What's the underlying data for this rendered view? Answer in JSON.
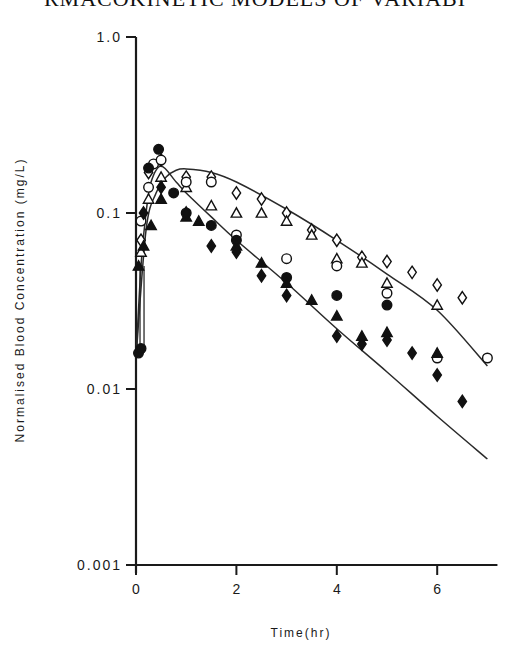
{
  "header": {
    "text": "RMACOKINETIC MODELS OF VARIABI"
  },
  "chart_data": {
    "type": "scatter",
    "title": "",
    "xlabel": "Time(hr)",
    "ylabel": "Normalised Blood Concentration (mg/L)",
    "xlim": [
      0,
      7.2
    ],
    "ylim": [
      0.001,
      1.0
    ],
    "yscale": "log",
    "grid": false,
    "legend": null,
    "x_ticks": [
      "0",
      "2",
      "4",
      "6"
    ],
    "y_ticks": [
      "0.001",
      "0.01",
      "0.1",
      "1.0"
    ],
    "series": [
      {
        "name": "open diamond",
        "marker": "open-diamond",
        "x": [
          0.1,
          0.25,
          0.5,
          1.0,
          1.5,
          2.0,
          2.5,
          3.0,
          3.5,
          4.0,
          4.5,
          5.0,
          5.5,
          6.0,
          6.5
        ],
        "y": [
          0.07,
          0.17,
          0.2,
          0.16,
          0.16,
          0.13,
          0.12,
          0.1,
          0.08,
          0.07,
          0.056,
          0.053,
          0.046,
          0.039,
          0.033
        ]
      },
      {
        "name": "open triangle",
        "marker": "open-triangle",
        "x": [
          0.1,
          0.25,
          0.5,
          1.0,
          1.5,
          2.0,
          2.5,
          3.0,
          3.5,
          4.0,
          4.5,
          5.0,
          6.0
        ],
        "y": [
          0.06,
          0.12,
          0.16,
          0.14,
          0.11,
          0.1,
          0.1,
          0.09,
          0.075,
          0.055,
          0.052,
          0.04,
          0.03
        ]
      },
      {
        "name": "open circle",
        "marker": "open-circle",
        "x": [
          0.1,
          0.25,
          0.35,
          0.5,
          1.0,
          1.5,
          2.0,
          3.0,
          4.0,
          5.0,
          6.0,
          7.0
        ],
        "y": [
          0.09,
          0.14,
          0.19,
          0.2,
          0.15,
          0.15,
          0.075,
          0.055,
          0.05,
          0.035,
          0.015,
          0.015
        ]
      },
      {
        "name": "filled circle",
        "marker": "filled-circle",
        "x": [
          0.05,
          0.1,
          0.25,
          0.45,
          0.75,
          1.0,
          1.5,
          2.0,
          3.0,
          4.0,
          5.0
        ],
        "y": [
          0.016,
          0.017,
          0.18,
          0.23,
          0.13,
          0.1,
          0.085,
          0.07,
          0.043,
          0.034,
          0.03
        ]
      },
      {
        "name": "filled triangle",
        "marker": "filled-triangle",
        "x": [
          0.05,
          0.15,
          0.3,
          0.5,
          1.0,
          1.25,
          2.0,
          2.5,
          3.0,
          3.5,
          4.0,
          4.5,
          5.0,
          6.0
        ],
        "y": [
          0.05,
          0.065,
          0.085,
          0.12,
          0.095,
          0.09,
          0.065,
          0.052,
          0.04,
          0.032,
          0.026,
          0.02,
          0.021,
          0.016
        ]
      },
      {
        "name": "filled diamond",
        "marker": "filled-diamond",
        "x": [
          0.15,
          0.5,
          1.0,
          1.5,
          2.0,
          2.5,
          3.0,
          4.0,
          4.5,
          5.0,
          5.5,
          6.0,
          6.5
        ],
        "y": [
          0.1,
          0.14,
          0.1,
          0.065,
          0.06,
          0.044,
          0.034,
          0.02,
          0.018,
          0.019,
          0.016,
          0.012,
          0.0085
        ]
      }
    ],
    "fitted_curves": [
      {
        "name": "upper fit",
        "x": [
          0.0,
          0.2,
          0.4,
          0.6,
          0.8,
          1.0,
          1.5,
          2.0,
          3.0,
          4.0,
          5.0,
          6.0,
          7.0
        ],
        "y": [
          0.015,
          0.08,
          0.13,
          0.16,
          0.175,
          0.178,
          0.17,
          0.15,
          0.105,
          0.07,
          0.045,
          0.028,
          0.0135
        ]
      },
      {
        "name": "lower fit",
        "x": [
          0.0,
          0.1,
          0.2,
          0.3,
          0.5,
          0.8,
          1.0,
          1.5,
          2.0,
          3.0,
          4.0,
          5.0,
          6.0,
          7.0
        ],
        "y": [
          0.015,
          0.05,
          0.1,
          0.15,
          0.185,
          0.15,
          0.13,
          0.095,
          0.07,
          0.04,
          0.022,
          0.0125,
          0.007,
          0.004
        ]
      }
    ]
  }
}
